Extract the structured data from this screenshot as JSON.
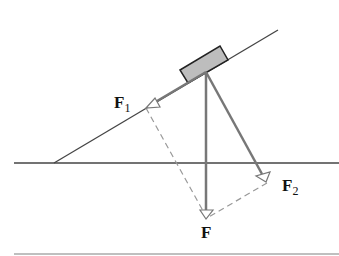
{
  "diagram": {
    "labels": {
      "F1": {
        "main": "F",
        "sub": "1"
      },
      "F2": {
        "main": "F",
        "sub": "2"
      },
      "F": {
        "main": "F"
      }
    },
    "colors": {
      "line": "#333333",
      "vector": "#777777",
      "dashed": "#999999",
      "block_fill": "#bdbdbd",
      "block_stroke": "#222222",
      "bottom_rule": "#aaaaaa"
    }
  }
}
